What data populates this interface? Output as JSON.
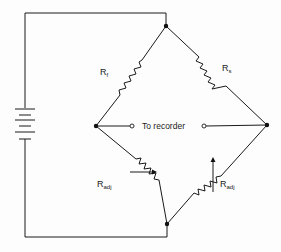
{
  "diagram": {
    "type": "wheatstone-bridge",
    "colors": {
      "line": "#1a1a1a",
      "background": "#fdfdfd"
    },
    "labels": {
      "r_top_left": {
        "main": "R",
        "sub": "f"
      },
      "r_top_right": {
        "main": "R",
        "sub": "s"
      },
      "r_bottom_left": {
        "main": "R",
        "sub": "adj"
      },
      "r_bottom_right": {
        "main": "R",
        "sub": "adj"
      },
      "recorder": "To recorder"
    },
    "components": [
      {
        "id": "battery",
        "kind": "battery",
        "cells": 3
      },
      {
        "id": "Rf",
        "kind": "resistor",
        "branch": "top-left"
      },
      {
        "id": "Rs",
        "kind": "resistor",
        "branch": "top-right"
      },
      {
        "id": "Radj-left",
        "kind": "variable-resistor",
        "branch": "bottom-left"
      },
      {
        "id": "Radj-right",
        "kind": "variable-resistor",
        "branch": "bottom-right"
      },
      {
        "id": "recorder-terminals",
        "kind": "output-terminals"
      }
    ]
  }
}
